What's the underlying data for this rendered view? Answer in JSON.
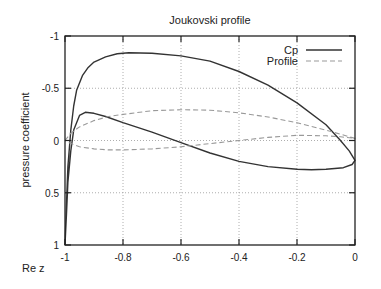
{
  "chart_data": {
    "type": "line",
    "title": "Joukovski profile",
    "xlabel": "Re z",
    "ylabel": "pressure coefficient",
    "xlim": [
      -1,
      0
    ],
    "ylim": [
      1,
      -1
    ],
    "y_inverted": true,
    "grid": true,
    "legend_position": "top-right",
    "x_ticks": [
      -1,
      -0.8,
      -0.6,
      -0.4,
      -0.2,
      0
    ],
    "x_tick_labels": [
      "-1",
      "-0.8",
      "-0.6",
      "-0.4",
      "-0.2",
      "0"
    ],
    "y_ticks": [
      -1,
      -0.5,
      0,
      0.5,
      1
    ],
    "y_tick_labels": [
      "-1",
      "-0.5",
      "0",
      "0.5",
      "1"
    ],
    "series": [
      {
        "name": "Cp",
        "style": "solid",
        "color": "#333333",
        "points": [
          [
            -1.0,
            1.0
          ],
          [
            -0.995,
            0.6
          ],
          [
            -0.99,
            0.25
          ],
          [
            -0.98,
            -0.1
          ],
          [
            -0.97,
            -0.33
          ],
          [
            -0.96,
            -0.48
          ],
          [
            -0.94,
            -0.62
          ],
          [
            -0.92,
            -0.7
          ],
          [
            -0.9,
            -0.75
          ],
          [
            -0.86,
            -0.8
          ],
          [
            -0.82,
            -0.83
          ],
          [
            -0.78,
            -0.84
          ],
          [
            -0.7,
            -0.835
          ],
          [
            -0.6,
            -0.81
          ],
          [
            -0.5,
            -0.76
          ],
          [
            -0.4,
            -0.66
          ],
          [
            -0.3,
            -0.53
          ],
          [
            -0.2,
            -0.36
          ],
          [
            -0.1,
            -0.15
          ],
          [
            -0.05,
            0.0
          ],
          [
            -0.02,
            0.1
          ],
          [
            0.0,
            0.19
          ],
          [
            -0.01,
            0.23
          ],
          [
            -0.04,
            0.26
          ],
          [
            -0.1,
            0.275
          ],
          [
            -0.15,
            0.28
          ],
          [
            -0.2,
            0.275
          ],
          [
            -0.3,
            0.25
          ],
          [
            -0.4,
            0.2
          ],
          [
            -0.5,
            0.12
          ],
          [
            -0.6,
            0.02
          ],
          [
            -0.7,
            -0.08
          ],
          [
            -0.8,
            -0.17
          ],
          [
            -0.86,
            -0.23
          ],
          [
            -0.9,
            -0.26
          ],
          [
            -0.93,
            -0.27
          ],
          [
            -0.95,
            -0.24
          ],
          [
            -0.97,
            -0.1
          ],
          [
            -0.98,
            0.1
          ],
          [
            -0.99,
            0.4
          ],
          [
            -0.995,
            0.7
          ],
          [
            -1.0,
            1.0
          ]
        ]
      },
      {
        "name": "Profile",
        "style": "dashed",
        "color": "#999999",
        "points": [
          [
            -1.0,
            0.0
          ],
          [
            -0.98,
            -0.07
          ],
          [
            -0.95,
            -0.13
          ],
          [
            -0.9,
            -0.19
          ],
          [
            -0.85,
            -0.23
          ],
          [
            -0.8,
            -0.25
          ],
          [
            -0.7,
            -0.285
          ],
          [
            -0.6,
            -0.295
          ],
          [
            -0.5,
            -0.29
          ],
          [
            -0.4,
            -0.265
          ],
          [
            -0.3,
            -0.225
          ],
          [
            -0.2,
            -0.17
          ],
          [
            -0.1,
            -0.1
          ],
          [
            -0.05,
            -0.06
          ],
          [
            0.0,
            -0.02
          ],
          [
            -0.05,
            -0.035
          ],
          [
            -0.1,
            -0.045
          ],
          [
            -0.2,
            -0.05
          ],
          [
            -0.3,
            -0.03
          ],
          [
            -0.4,
            0.0
          ],
          [
            -0.5,
            0.03
          ],
          [
            -0.6,
            0.06
          ],
          [
            -0.7,
            0.08
          ],
          [
            -0.8,
            0.09
          ],
          [
            -0.85,
            0.09
          ],
          [
            -0.9,
            0.08
          ],
          [
            -0.95,
            0.06
          ],
          [
            -0.98,
            0.03
          ],
          [
            -1.0,
            0.0
          ]
        ]
      }
    ]
  },
  "layout": {
    "plot_left": 65,
    "plot_right": 355,
    "plot_top": 36,
    "plot_bottom": 245
  }
}
